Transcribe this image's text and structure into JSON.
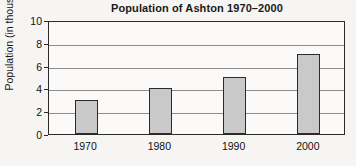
{
  "chart_data": {
    "type": "bar",
    "title": "Population of Ashton 1970–2000",
    "xlabel": "",
    "ylabel": "Population (in thousands)",
    "categories": [
      "1970",
      "1980",
      "1990",
      "2000"
    ],
    "values": [
      3,
      4,
      5,
      7
    ],
    "series": [
      {
        "name": "Population",
        "values": [
          3,
          4,
          5,
          7
        ]
      }
    ],
    "ylim": [
      0,
      10
    ],
    "yticks": [
      0,
      2,
      4,
      6,
      8,
      10
    ],
    "ytick_labels": [
      "0",
      "2",
      "4",
      "6",
      "8",
      "10"
    ],
    "grid": true,
    "legend": false,
    "legend_position": "none",
    "bar_color": "#c9c9c9",
    "bar_edge_color": "#2b2b2b",
    "axis_color": "#2b2b2b",
    "gridline_color": "#8c8c8c",
    "background_color": "#f6f5f3",
    "plot_background_color": "#fbfaf9",
    "text_color": "#111111"
  }
}
